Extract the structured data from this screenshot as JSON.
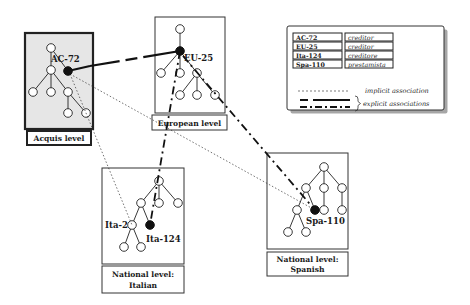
{
  "diagram": {
    "levels": [
      {
        "id": "acquis",
        "label_lines": [
          "Acquis level"
        ],
        "shaded": true,
        "box": [
          25,
          33,
          68,
          96
        ],
        "label_box": [
          27,
          131,
          64,
          14
        ]
      },
      {
        "id": "european",
        "label_lines": [
          "European level"
        ],
        "shaded": false,
        "box": [
          155,
          17,
          70,
          96
        ],
        "label_box": [
          152,
          115,
          75,
          15
        ]
      },
      {
        "id": "italian",
        "label_lines": [
          "National level:",
          "Italian"
        ],
        "shaded": false,
        "box": [
          102,
          168,
          82,
          96
        ],
        "label_box": [
          102,
          266,
          82,
          27
        ]
      },
      {
        "id": "spanish",
        "label_lines": [
          "National level:",
          "Spanish"
        ],
        "shaded": false,
        "box": [
          267,
          153,
          81,
          96
        ],
        "label_box": [
          267,
          252,
          81,
          24
        ]
      }
    ],
    "concepts": [
      {
        "id": "AC-72",
        "label": "AC-72",
        "level": "acquis",
        "x": 68,
        "y": 71,
        "label_x": 51,
        "label_y": 63
      },
      {
        "id": "EU-25",
        "label": "EU-25",
        "level": "european",
        "x": 180,
        "y": 51,
        "label_x": 183,
        "label_y": 60
      },
      {
        "id": "Ita-124",
        "label": "Ita-124",
        "level": "italian",
        "x": 150,
        "y": 225,
        "label_x": 146,
        "label_y": 242
      },
      {
        "id": "Ita-2",
        "label": "Ita-2",
        "level": "italian",
        "x": 132,
        "y": 225,
        "label_x": 105,
        "label_y": 228
      },
      {
        "id": "Spa-110",
        "label": "Spa-110",
        "level": "spanish",
        "x": 315,
        "y": 210,
        "label_x": 306,
        "label_y": 224
      }
    ],
    "explicit_associations": [
      {
        "from": "AC-72",
        "to": "EU-25",
        "style": "dashed"
      },
      {
        "from": "EU-25",
        "to": "Ita-124",
        "style": "dash-dot"
      },
      {
        "from": "EU-25",
        "to": "Spa-110",
        "style": "dash-dot"
      }
    ],
    "implicit_associations": [
      {
        "from": "AC-72",
        "to": "Ita-2"
      },
      {
        "from": "AC-72",
        "to": "Spa-110"
      }
    ]
  },
  "legend": {
    "terms": [
      {
        "id": "AC-72",
        "term": "creditor"
      },
      {
        "id": "EU-25",
        "term": "creditor"
      },
      {
        "id": "Ita-124",
        "term": "creditore"
      },
      {
        "id": "Spa-110",
        "term": "prestamista"
      }
    ],
    "implicit_label": "implicit association",
    "explicit_label": "explicit associations"
  },
  "colors": {
    "line": "#1a1a1a",
    "acquis_fill": "#e6e6e6",
    "box_border": "#333333"
  }
}
